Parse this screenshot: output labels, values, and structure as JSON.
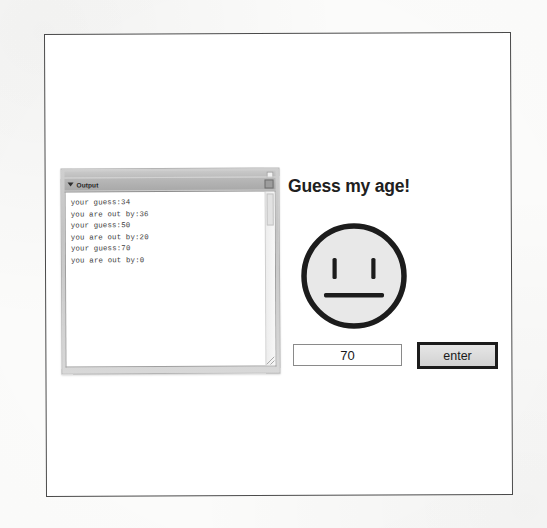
{
  "app": {
    "heading": "Guess my age!"
  },
  "output_window": {
    "title": "Output",
    "disclosure_icon": "triangle-down-icon",
    "titlebar_button_icon": "window-menu-icon",
    "resize_grip_icon": "resize-grip-icon",
    "console_lines": [
      "your guess:34",
      "you are out by:36",
      "your guess:50",
      "you are out by:20",
      "your guess:70",
      "you are out by:0"
    ]
  },
  "face": {
    "expression": "neutral-face-icon",
    "fill_color": "#e8e8e8",
    "stroke_color": "#1c1c1c"
  },
  "controls": {
    "guess_value": "70",
    "guess_placeholder": "",
    "enter_label": "enter"
  },
  "colors": {
    "page_background": "#ffffff",
    "frame_border": "#4a4a4a",
    "window_chrome": "#c4c4c4",
    "text": "#1a1a1a",
    "console_text": "#3a3a3a"
  }
}
